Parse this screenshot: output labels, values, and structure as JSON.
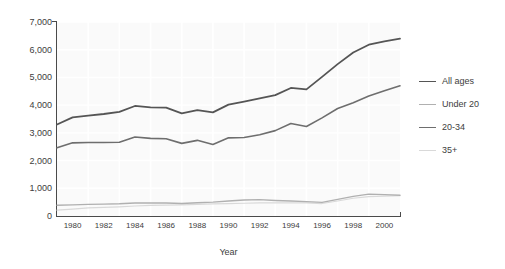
{
  "chart_data": {
    "type": "line",
    "title": "",
    "subtitle": "",
    "xlabel": "Year",
    "ylabel": "",
    "xlim": [
      1979,
      2001
    ],
    "ylim": [
      0,
      7000
    ],
    "grid": true,
    "legend_position": "right",
    "x": [
      1979,
      1980,
      1981,
      1982,
      1983,
      1984,
      1985,
      1986,
      1987,
      1988,
      1989,
      1990,
      1991,
      1992,
      1993,
      1994,
      1995,
      1996,
      1997,
      1998,
      1999,
      2000,
      2001
    ],
    "xtick_labels": [
      "1980",
      "1982",
      "1984",
      "1986",
      "1988",
      "1990",
      "1992",
      "1994",
      "1996",
      "1998",
      "2000"
    ],
    "xticks": [
      1980,
      1982,
      1984,
      1986,
      1988,
      1990,
      1992,
      1994,
      1996,
      1998,
      2000
    ],
    "ytick_labels": [
      "0",
      "1,000",
      "2,000",
      "3,000",
      "4,000",
      "5,000",
      "6,000",
      "7,000"
    ],
    "yticks": [
      0,
      1000,
      2000,
      3000,
      4000,
      5000,
      6000,
      7000
    ],
    "series": [
      {
        "name": "All ages",
        "color": "#555555",
        "width": 1.8,
        "values": [
          3300,
          3560,
          3620,
          3680,
          3760,
          3970,
          3920,
          3910,
          3700,
          3820,
          3740,
          4020,
          4130,
          4240,
          4360,
          4620,
          4570,
          5020,
          5480,
          5900,
          6180,
          6300,
          6400
        ]
      },
      {
        "name": "Under 20",
        "color": "#b0b0b0",
        "width": 1.4,
        "values": [
          390,
          400,
          420,
          430,
          440,
          470,
          470,
          470,
          450,
          480,
          500,
          540,
          580,
          590,
          560,
          540,
          520,
          490,
          600,
          710,
          790,
          770,
          750
        ]
      },
      {
        "name": "20-34",
        "color": "#6e6e6e",
        "width": 1.6,
        "values": [
          2460,
          2640,
          2650,
          2650,
          2660,
          2850,
          2800,
          2790,
          2620,
          2730,
          2580,
          2820,
          2830,
          2930,
          3080,
          3340,
          3230,
          3540,
          3880,
          4090,
          4330,
          4520,
          4700
        ]
      },
      {
        "name": "35+",
        "color": "#d9d9d9",
        "width": 1.2,
        "values": [
          210,
          250,
          290,
          310,
          330,
          360,
          380,
          390,
          400,
          420,
          440,
          450,
          460,
          470,
          470,
          470,
          470,
          450,
          540,
          640,
          700,
          720,
          730
        ]
      }
    ]
  }
}
